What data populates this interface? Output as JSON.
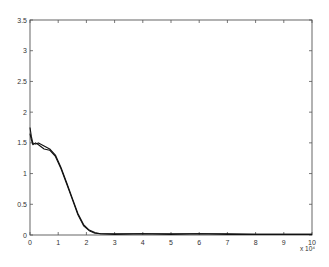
{
  "chart_data": {
    "type": "line",
    "title": "",
    "xlabel": "",
    "ylabel": "",
    "x_multiplier_label": "x 10⁴",
    "xlim": [
      0,
      100000
    ],
    "ylim": [
      0,
      3.5
    ],
    "grid": false,
    "legend": null,
    "x_ticks": [
      "0",
      "1",
      "2",
      "3",
      "4",
      "5",
      "6",
      "7",
      "8",
      "9",
      "10"
    ],
    "y_ticks": [
      "0",
      "0.5",
      "1",
      "1.5",
      "2",
      "2.5",
      "3",
      "3.5"
    ],
    "series": [
      {
        "name": "curve-1",
        "x": [
          0,
          500,
          1000,
          2000,
          3000,
          5000,
          7000,
          9000,
          11000,
          13000,
          15000,
          17000,
          19000,
          21000,
          23000,
          25000,
          30000,
          40000,
          50000,
          60000,
          70000,
          80000,
          90000,
          100000
        ],
        "values": [
          1.75,
          1.6,
          1.5,
          1.48,
          1.5,
          1.45,
          1.4,
          1.3,
          1.1,
          0.85,
          0.6,
          0.35,
          0.17,
          0.08,
          0.04,
          0.02,
          0.02,
          0.02,
          0.02,
          0.02,
          0.02,
          0.01,
          0.01,
          0.01
        ]
      },
      {
        "name": "curve-2",
        "x": [
          0,
          500,
          1000,
          2000,
          3000,
          5000,
          7000,
          9000,
          11000,
          13000,
          15000,
          17000,
          19000,
          21000,
          23000,
          25000,
          30000,
          40000,
          50000,
          60000,
          70000,
          80000,
          90000,
          100000
        ],
        "values": [
          1.65,
          1.55,
          1.47,
          1.5,
          1.47,
          1.4,
          1.38,
          1.28,
          1.08,
          0.83,
          0.58,
          0.33,
          0.15,
          0.07,
          0.03,
          0.02,
          0.01,
          0.02,
          0.01,
          0.02,
          0.01,
          0.01,
          0.01,
          0.01
        ]
      }
    ]
  }
}
